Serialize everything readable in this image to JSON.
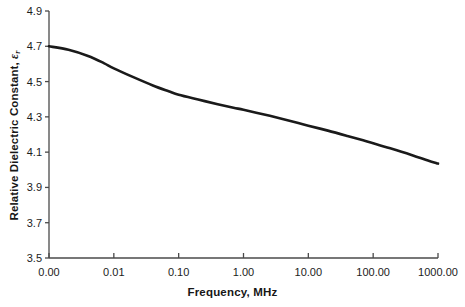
{
  "chart_data": {
    "type": "line",
    "title": "",
    "xlabel": "Frequency, MHz",
    "ylabel_prefix": "Relative Dielectric Constant, ",
    "ylabel_symbol": "ε",
    "ylabel_subscript": "r",
    "xscale": "log",
    "xtick_labels": [
      "0.00",
      "0.01",
      "0.10",
      "1.00",
      "10.00",
      "100.00",
      "1000.00"
    ],
    "xtick_values": [
      0.001,
      0.01,
      0.1,
      1,
      10,
      100,
      1000
    ],
    "ytick_labels": [
      "3.5",
      "3.7",
      "3.9",
      "4.1",
      "4.3",
      "4.5",
      "4.7",
      "4.9"
    ],
    "ytick_values": [
      3.5,
      3.7,
      3.9,
      4.1,
      4.3,
      4.5,
      4.7,
      4.9
    ],
    "ylim": [
      3.5,
      4.9
    ],
    "xlim_labels": [
      "0.00",
      "1000.00"
    ],
    "grid": false,
    "legend": null,
    "series": [
      {
        "name": "Relative dielectric constant vs frequency",
        "color": "#1a1a1a",
        "line_width": 2.6,
        "x": [
          0.001,
          0.002,
          0.004,
          0.007,
          0.01,
          0.02,
          0.04,
          0.07,
          0.1,
          0.2,
          0.4,
          0.7,
          1.0,
          2.0,
          4.0,
          7.0,
          10.0,
          20.0,
          40.0,
          70.0,
          100.0,
          200.0,
          400.0,
          700.0,
          1000.0
        ],
        "y": [
          4.7,
          4.68,
          4.645,
          4.605,
          4.575,
          4.525,
          4.478,
          4.445,
          4.425,
          4.398,
          4.372,
          4.352,
          4.34,
          4.315,
          4.288,
          4.265,
          4.25,
          4.222,
          4.192,
          4.167,
          4.15,
          4.118,
          4.083,
          4.053,
          4.035
        ]
      }
    ]
  },
  "axes": {
    "plot_left_px": 49,
    "plot_right_px": 438,
    "plot_top_px": 11,
    "plot_bottom_px": 258
  }
}
